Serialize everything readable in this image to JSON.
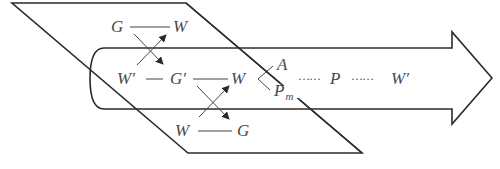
{
  "diagram": {
    "type": "capital-circulation-schematic",
    "colors": {
      "stroke": "#2b2b2b",
      "text": "#4a4a4a",
      "background": "#ffffff"
    },
    "shapes": {
      "plane": {
        "kind": "parallelogram",
        "label": ""
      },
      "flow_arrow": {
        "kind": "block-arrow-right",
        "label": ""
      }
    },
    "labels": {
      "top_left": "G",
      "top_right": "W",
      "mid_w_prime": "W′",
      "mid_g_prime": "G′",
      "mid_w": "W",
      "branch_a": "A",
      "branch_p": "P",
      "branch_p_sub": "m",
      "chain_p": "P",
      "chain_w_prime": "W′",
      "bottom_left": "W",
      "bottom_right": "G",
      "dots_1": "……",
      "dots_2": "……"
    },
    "connectors": [
      {
        "from": "G (top)",
        "to": "W (top)",
        "style": "line"
      },
      {
        "from": "G (top)",
        "to": "G′",
        "style": "arrow"
      },
      {
        "from": "W′",
        "to": "W (top)",
        "style": "arrow"
      },
      {
        "from": "W′",
        "to": "G′",
        "style": "line"
      },
      {
        "from": "G′",
        "to": "W (middle)",
        "style": "line"
      },
      {
        "from": "G′",
        "to": "G (bottom)",
        "style": "arrow"
      },
      {
        "from": "W (bottom)",
        "to": "W (middle)",
        "style": "arrow"
      },
      {
        "from": "W (bottom)",
        "to": "G (bottom)",
        "style": "line"
      },
      {
        "from": "W (middle)",
        "to": "A",
        "style": "branch"
      },
      {
        "from": "W (middle)",
        "to": "Pm",
        "style": "branch"
      },
      {
        "from": "A/Pm",
        "to": "P",
        "style": "dotted"
      },
      {
        "from": "P",
        "to": "W′",
        "style": "dotted"
      }
    ]
  }
}
